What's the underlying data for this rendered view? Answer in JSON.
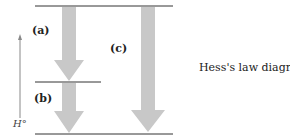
{
  "diagram": {
    "labels": {
      "a": "(a)",
      "b": "(b)",
      "c": "(c)"
    },
    "axis_label": "H°",
    "caption": "Hess's law diagram",
    "colors": {
      "arrow": "#c8c8c8",
      "line": "#333333",
      "axis": "#888888"
    }
  }
}
